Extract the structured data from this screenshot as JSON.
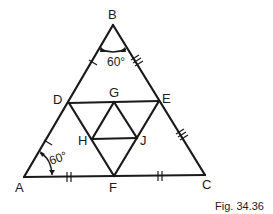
{
  "figure": {
    "caption": "Fig. 34.36",
    "points": {
      "A": {
        "label": "A",
        "x": 24,
        "y": 177
      },
      "B": {
        "label": "B",
        "x": 113,
        "y": 25
      },
      "C": {
        "label": "C",
        "x": 205,
        "y": 175
      },
      "D": {
        "label": "D",
        "x": 69,
        "y": 103
      },
      "E": {
        "label": "E",
        "x": 159,
        "y": 101
      },
      "F": {
        "label": "F",
        "x": 114,
        "y": 176
      },
      "G": {
        "label": "G",
        "x": 114,
        "y": 102
      },
      "H": {
        "label": "H",
        "x": 92,
        "y": 139
      },
      "J": {
        "label": "J",
        "x": 137,
        "y": 138
      }
    },
    "segments": [
      "AB",
      "BC",
      "CA",
      "DE",
      "DF",
      "EF",
      "GH",
      "GJ",
      "HJ"
    ],
    "angles": [
      {
        "vertex": "B",
        "label": "60°"
      },
      {
        "vertex": "A",
        "label": "60°"
      }
    ],
    "tick_marks": [
      {
        "segment": "BD",
        "count": 1
      },
      {
        "segment": "DA",
        "count": 1
      },
      {
        "segment": "BE",
        "count": 3
      },
      {
        "segment": "EC",
        "count": 3
      },
      {
        "segment": "AF",
        "count": 2
      },
      {
        "segment": "FC",
        "count": 2
      }
    ]
  }
}
